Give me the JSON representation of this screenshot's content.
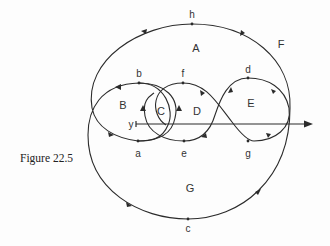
{
  "figure": {
    "caption": "Figure 22.5",
    "axis_label": "y",
    "points": {
      "h": "h",
      "b": "b",
      "f": "f",
      "d": "d",
      "a": "a",
      "e": "e",
      "g": "g",
      "c": "c"
    },
    "regions": {
      "A": "A",
      "B": "B",
      "C": "C",
      "D": "D",
      "E": "E",
      "F": "F",
      "G": "G"
    },
    "colors": {
      "stroke": "#2b2b2b",
      "text": "#333333",
      "background": "#fdfdfd"
    }
  }
}
